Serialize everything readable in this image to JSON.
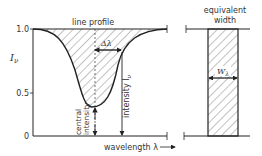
{
  "diagram": {
    "labels": {
      "line_profile": "line profile",
      "equivalent_width_line1": "equivalent",
      "equivalent_width_line2": "width",
      "y_axis": "I",
      "y_axis_sub": "ν",
      "delta_lambda": "Δλ",
      "intensity": "intensity I",
      "intensity_sub": "ν",
      "central_line1": "central",
      "central_line2": "intensity",
      "wavelength": "wavelength λ",
      "w_lambda": "W",
      "w_lambda_sub": "λ"
    },
    "ticks": {
      "y": [
        "1.0",
        "0.5",
        "0"
      ]
    },
    "colors": {
      "stroke": "#222222",
      "hatch": "#555555",
      "text": "#333333"
    }
  }
}
